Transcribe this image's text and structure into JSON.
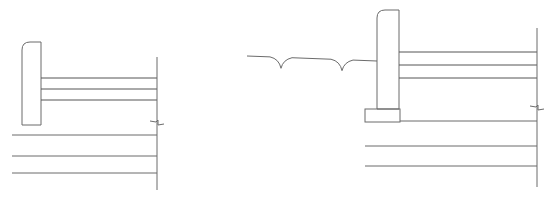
{
  "canvas": {
    "width": 553,
    "height": 202,
    "background": "#ffffff",
    "line_color": "#6b6b6b"
  },
  "drawings": [
    {
      "id": "section-left",
      "curb": {
        "x": 22,
        "y": 42,
        "w": 19,
        "h": 83,
        "corner_radius": 8
      },
      "upper_lines_y": [
        78,
        89,
        100
      ],
      "upper_lines_x": [
        41,
        157
      ],
      "lower_lines_y": [
        135,
        156,
        173
      ],
      "lower_lines_x": [
        12,
        157
      ],
      "edge_line": {
        "x": 157,
        "y1": 57,
        "y2": 190
      },
      "break_mark": {
        "x": 157,
        "y": 123
      }
    },
    {
      "id": "section-right",
      "curb": {
        "x": 377,
        "y": 10,
        "w": 22,
        "h": 99,
        "corner_radius": 8
      },
      "footing": {
        "x": 365,
        "y": 109,
        "w": 35,
        "h": 13
      },
      "upper_lines_y": [
        52,
        65,
        78
      ],
      "upper_lines_x": [
        399,
        537
      ],
      "lower_lines_y": [
        146,
        166
      ],
      "lower_lines_x": [
        365,
        537
      ],
      "footing_base_line": {
        "x1": 400,
        "x2": 537,
        "y": 121
      },
      "edge_line": {
        "x": 537,
        "y1": 28,
        "y2": 187
      },
      "break_mark": {
        "x": 537,
        "y": 108
      },
      "ground_line": {
        "x_start": 247,
        "y_start": 56,
        "x_end": 377,
        "y_end": 61,
        "scallops_x": [
          281,
          342
        ],
        "scallop_depth": 11,
        "scallop_half_width": 11
      }
    }
  ]
}
